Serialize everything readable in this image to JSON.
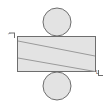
{
  "figure": {
    "canvas": {
      "width": 107,
      "height": 105,
      "background": "#ffffff"
    },
    "style": {
      "fill": "#e3e3e3",
      "stroke": "#6e6e6e",
      "stroke_width": 1,
      "diagonal_stroke": "#9a9a9a",
      "diagonal_stroke_width": 1,
      "label_color": "#4a4a4a"
    },
    "labels": {
      "top_left": "⌐",
      "bottom_right": "L"
    },
    "shapes": [
      {
        "name": "top-roller",
        "type": "circle",
        "cx": 57,
        "cy": 22,
        "r": 14,
        "fill": "#e3e3e3",
        "stroke": "#6e6e6e"
      },
      {
        "name": "slab-body",
        "type": "rect",
        "x": 17,
        "y": 36,
        "width": 79,
        "height": 36,
        "fill": "#e3e3e3",
        "stroke": "#6e6e6e"
      },
      {
        "name": "bottom-roller",
        "type": "circle",
        "cx": 57,
        "cy": 86,
        "r": 14,
        "fill": "#e3e3e3",
        "stroke": "#6e6e6e"
      },
      {
        "name": "shear-plane-upper",
        "type": "line",
        "x1": 17,
        "y1": 41,
        "x2": 96,
        "y2": 56,
        "stroke": "#9a9a9a"
      },
      {
        "name": "shear-plane-lower",
        "type": "line",
        "x1": 17,
        "y1": 58,
        "x2": 96,
        "y2": 72,
        "stroke": "#9a9a9a"
      }
    ]
  }
}
